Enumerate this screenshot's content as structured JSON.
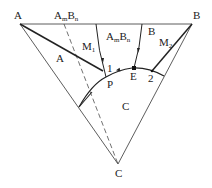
{
  "diagram": {
    "type": "ternary-phase-diagram",
    "vertices": [
      {
        "label": "A"
      },
      {
        "label": "B"
      },
      {
        "label": "C"
      }
    ],
    "regions": [
      {
        "label": "A"
      },
      {
        "label": "B"
      },
      {
        "label": "C"
      }
    ],
    "compound": {
      "base1": "A",
      "sub1": "m",
      "base2": "B",
      "sub2": "n"
    },
    "compound_region": {
      "base1": "A",
      "sub1": "m",
      "base2": "B",
      "sub2": "n"
    },
    "points": [
      {
        "label": "M",
        "sub": "1"
      },
      {
        "label": "M",
        "sub": "2"
      },
      {
        "label": "1"
      },
      {
        "label": "2"
      },
      {
        "label": "P"
      },
      {
        "label": "E"
      }
    ],
    "colors": {
      "line": "#333333",
      "background": "#ffffff"
    }
  }
}
